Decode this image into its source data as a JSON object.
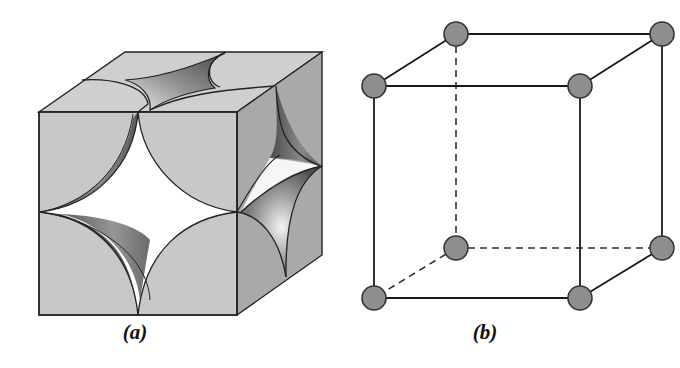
{
  "figures": [
    {
      "id": "a",
      "caption": "(a)",
      "description": "Simple cubic unit cell shown as space-filling model: eight corner atoms sectioned by the cube faces, each contributing an eighth-sphere",
      "colors": {
        "face_fill": "#c8c8c8",
        "side_fill": "#a9a9a9",
        "top_fill": "#cfcfcf",
        "void_fill": "#ffffff",
        "edge": "#222222",
        "shadow": "#5e5e5e"
      }
    },
    {
      "id": "b",
      "caption": "(b)",
      "description": "Simple cubic unit cell shown as ball-and-stick lattice model with atoms at the eight corners; hidden edges dashed",
      "atom_count": 8,
      "atoms": [
        {
          "name": "front-top-left",
          "x": 34,
          "y": 86
        },
        {
          "name": "front-top-right",
          "x": 240,
          "y": 86
        },
        {
          "name": "back-top-left",
          "x": 116,
          "y": 34
        },
        {
          "name": "back-top-right",
          "x": 322,
          "y": 34
        },
        {
          "name": "front-bottom-left",
          "x": 34,
          "y": 298
        },
        {
          "name": "front-bottom-right",
          "x": 240,
          "y": 298
        },
        {
          "name": "back-bottom-left",
          "x": 116,
          "y": 248
        },
        {
          "name": "back-bottom-right",
          "x": 322,
          "y": 248
        }
      ],
      "colors": {
        "atom_fill": "#8e8e8e",
        "atom_stroke": "#333333",
        "edge": "#1a1a1a",
        "hidden_edge": "#333333"
      }
    }
  ]
}
